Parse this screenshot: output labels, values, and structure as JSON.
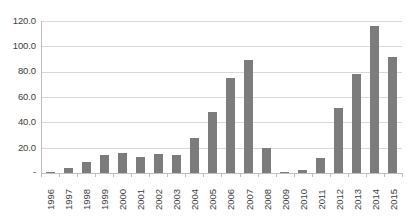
{
  "chart_data": {
    "type": "bar",
    "title": "",
    "subtitle": "",
    "xlabel": "",
    "ylabel": "",
    "categories": [
      "1996",
      "1997",
      "1998",
      "1999",
      "2000",
      "2001",
      "2002",
      "2003",
      "2004",
      "2005",
      "2006",
      "2007",
      "2008",
      "2009",
      "2010",
      "2011",
      "2012",
      "2013",
      "2014",
      "2015"
    ],
    "values": [
      1.0,
      4.0,
      9.0,
      14.0,
      16.0,
      13.0,
      15.0,
      14.0,
      28.0,
      48.5,
      75.0,
      89.0,
      19.5,
      0.3,
      2.0,
      11.5,
      51.0,
      78.5,
      116.0,
      91.5
    ],
    "ylim": [
      0,
      120
    ],
    "y_ticks": [
      0,
      20,
      40,
      60,
      80,
      100,
      120
    ],
    "y_tick_labels": [
      "-",
      "20.0",
      "40.0",
      "60.0",
      "80.0",
      "100.0",
      "120.0"
    ],
    "grid": true,
    "legend": false,
    "legend_position": "none",
    "series": [
      {
        "name": "",
        "values": [
          1.0,
          4.0,
          9.0,
          14.0,
          16.0,
          13.0,
          15.0,
          14.0,
          28.0,
          48.5,
          75.0,
          89.0,
          19.5,
          0.3,
          2.0,
          11.5,
          51.0,
          78.5,
          116.0,
          91.5
        ],
        "color": "#7c7c7c"
      }
    ],
    "colors": {
      "bar": "#7c7c7c",
      "gridline": "#d9d9d9",
      "axis": "#bfbfbf",
      "text": "#3d3d3d",
      "background": "#ffffff"
    }
  }
}
